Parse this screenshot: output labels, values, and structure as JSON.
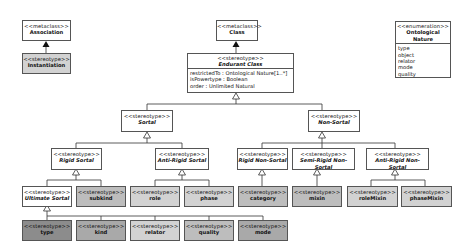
{
  "diagram": {
    "association": {
      "stereotype": "<<metaclass>>",
      "name": "Association"
    },
    "instantiation": {
      "stereotype": "<<stereotype>>",
      "name": "Instantiation"
    },
    "class": {
      "stereotype": "<<metaclass>>",
      "name": "Class"
    },
    "endurant_class": {
      "stereotype": "<<stereotype>>",
      "name": "Endurant Class",
      "attributes": [
        "restrictedTo : Ontological Nature[1..*]",
        "isPowertype : Boolean",
        "order : Unlimited Natural"
      ]
    },
    "ontological_nature": {
      "stereotype": "<<enumeration>>",
      "name": "Ontological Nature",
      "literals": [
        "type",
        "object",
        "relator",
        "mode",
        "quality"
      ]
    },
    "sortal": {
      "stereotype": "<<stereotype>>",
      "name": "Sortal"
    },
    "non_sortal": {
      "stereotype": "<<stereotype>>",
      "name": "Non-Sortal"
    },
    "rigid_sortal": {
      "stereotype": "<<stereotype>>",
      "name": "Rigid Sortal"
    },
    "anti_rigid_sortal": {
      "stereotype": "<<stereotype>>",
      "name": "Anti-Rigid Sortal"
    },
    "rigid_non_sortal": {
      "stereotype": "<<stereotype>>",
      "name": "Rigid Non-Sortal"
    },
    "semi_rigid_non_sortal": {
      "stereotype": "<<stereotype>>",
      "name": "Semi-Rigid Non-Sortal"
    },
    "anti_rigid_non_sortal": {
      "stereotype": "<<stereotype>>",
      "name": "Anti-Rigid Non-Sortal"
    },
    "ultimate_sortal": {
      "stereotype": "<<stereotype>>",
      "name": "Ultimate Sortal"
    },
    "subkind": {
      "stereotype": "<<stereotype>>",
      "name": "subkind"
    },
    "role": {
      "stereotype": "<<stereotype>>",
      "name": "role"
    },
    "phase": {
      "stereotype": "<<stereotype>>",
      "name": "phase"
    },
    "category": {
      "stereotype": "<<stereotype>>",
      "name": "category"
    },
    "mixin": {
      "stereotype": "<<stereotype>>",
      "name": "mixin"
    },
    "roleMixin": {
      "stereotype": "<<stereotype>>",
      "name": "roleMixin"
    },
    "phaseMixin": {
      "stereotype": "<<stereotype>>",
      "name": "phaseMixin"
    },
    "type": {
      "stereotype": "<<stereotype>>",
      "name": "type"
    },
    "kind": {
      "stereotype": "<<stereotype>>",
      "name": "kind"
    },
    "relator": {
      "stereotype": "<<stereotype>>",
      "name": "relator"
    },
    "quality": {
      "stereotype": "<<stereotype>>",
      "name": "quality"
    },
    "mode": {
      "stereotype": "<<stereotype>>",
      "name": "mode"
    }
  },
  "colors": {
    "white": "#ffffff",
    "light_gray": "#d2d2d2",
    "mid_gray": "#bdbdbd",
    "gray": "#a9a9a9",
    "dark_gray": "#8c8c8c",
    "border": "#555555"
  }
}
